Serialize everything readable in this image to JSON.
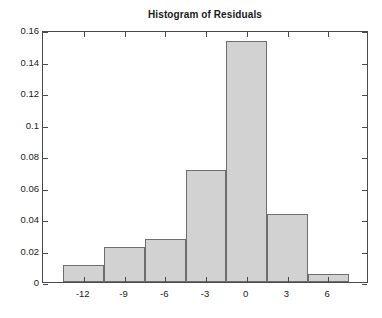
{
  "chart_data": {
    "type": "bar",
    "title": "Histogram of Residuals",
    "xlabel": "",
    "ylabel": "",
    "grid": false,
    "legend": false,
    "xlim": [
      -15,
      9
    ],
    "ylim": [
      0,
      0.16
    ],
    "bin_width": 3,
    "bin_edges": [
      -13.5,
      -10.5,
      -7.5,
      -4.5,
      -1.5,
      1.5,
      4.5,
      7.5
    ],
    "categories": [
      "-13.5 to -10.5",
      "-10.5 to -7.5",
      "-7.5 to -4.5",
      "-4.5 to -1.5",
      "-1.5 to 1.5",
      "1.5 to 4.5",
      "4.5 to 7.5"
    ],
    "values": [
      0.011,
      0.022,
      0.027,
      0.071,
      0.153,
      0.043,
      0.005
    ],
    "xticks": [
      -12,
      -9,
      -6,
      -3,
      0,
      3,
      6
    ],
    "xtick_labels": [
      "-12",
      "-9",
      "-6",
      "-3",
      "0",
      "3",
      "6"
    ],
    "yticks": [
      0,
      0.02,
      0.04,
      0.06,
      0.08,
      0.1,
      0.12,
      0.14,
      0.16
    ],
    "ytick_labels": [
      "0",
      "0.02",
      "0.04",
      "0.06",
      "0.08",
      "0.1",
      "0.12",
      "0.14",
      "0.16"
    ],
    "colors": {
      "bar_fill": "#d2d2d2",
      "bar_edge": "#6e6e6e",
      "axis": "#4a4a4a",
      "text": "#1a1a1a",
      "background": "#ffffff"
    }
  }
}
